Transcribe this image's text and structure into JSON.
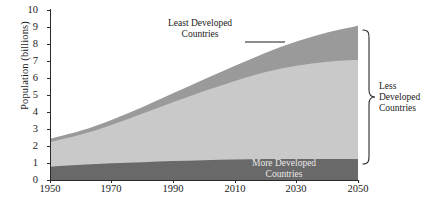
{
  "chart_data": {
    "type": "area",
    "title": "",
    "subtitle": "",
    "xlabel": "",
    "ylabel": "Population (billions)",
    "xlim": [
      1950,
      2050
    ],
    "ylim": [
      0,
      10
    ],
    "grid": false,
    "legend_position": "inline-annotations",
    "stacked": true,
    "x": [
      1950,
      1960,
      1970,
      1980,
      1990,
      2000,
      2010,
      2020,
      2030,
      2040,
      2050
    ],
    "xticks": [
      "1950",
      "1970",
      "1990",
      "2010",
      "2030",
      "2050"
    ],
    "yticks": [
      "0",
      "1",
      "2",
      "3",
      "4",
      "5",
      "6",
      "7",
      "8",
      "9",
      "10"
    ],
    "series": [
      {
        "name": "More Developed Countries",
        "color": "#696969",
        "values": [
          0.81,
          0.92,
          1.01,
          1.08,
          1.14,
          1.19,
          1.23,
          1.26,
          1.27,
          1.27,
          1.26
        ]
      },
      {
        "name": "Less Developed Countries",
        "color": "#c9c9c9",
        "values": [
          1.45,
          1.78,
          2.27,
          2.86,
          3.48,
          4.08,
          4.63,
          5.12,
          5.48,
          5.72,
          5.85
        ]
      },
      {
        "name": "Least Developed Countries",
        "color": "#9a9a9a",
        "values": [
          0.2,
          0.24,
          0.3,
          0.39,
          0.52,
          0.69,
          0.89,
          1.14,
          1.42,
          1.71,
          1.99
        ]
      }
    ],
    "totals": [
      2.46,
      2.94,
      3.58,
      4.33,
      5.14,
      5.96,
      6.75,
      7.52,
      8.17,
      8.7,
      9.1
    ],
    "annotations": [
      {
        "name": "least-developed-label",
        "text_line1": "Least Developed",
        "text_line2": "Countries",
        "has_leader_line": true
      },
      {
        "name": "more-developed-label",
        "text_line1": "More Developed",
        "text_line2": "Countries",
        "has_leader_line": false
      },
      {
        "name": "less-developed-label",
        "text_line1": "Less",
        "text_line2": "Developed",
        "text_line3": "Countries",
        "has_bracket": true
      }
    ]
  },
  "axis": {
    "y_title": "Population (billions)",
    "y_ticks": [
      "10",
      "9",
      "8",
      "7",
      "6",
      "5",
      "4",
      "3",
      "2",
      "1",
      "0"
    ],
    "x_ticks": [
      "1950",
      "1970",
      "1990",
      "2010",
      "2030",
      "2050"
    ]
  },
  "labels": {
    "least_line1": "Least Developed",
    "least_line2": "Countries",
    "more_line1": "More Developed",
    "more_line2": "Countries",
    "less_line1": "Less",
    "less_line2": "Developed",
    "less_line3": "Countries"
  },
  "colors": {
    "more_developed": "#696969",
    "less_developed": "#c9c9c9",
    "least_developed": "#9a9a9a",
    "axis": "#2b2b2b",
    "background": "#ffffff"
  }
}
